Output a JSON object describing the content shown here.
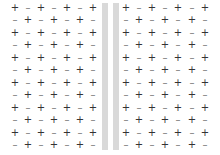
{
  "diagram": {
    "rows": 12,
    "cols_per_side": 7,
    "row_y": [
      8,
      20,
      33,
      45,
      58,
      70,
      83,
      95,
      108,
      120,
      133,
      145
    ],
    "left_col_x": [
      15,
      28,
      41,
      54,
      67,
      80,
      93
    ],
    "right_col_x": [
      126,
      139,
      152,
      165,
      178,
      192,
      205
    ],
    "plus_symbol": "+",
    "minus_symbol": "–",
    "odd_row_pattern": [
      "+",
      "–",
      "+",
      "–",
      "+",
      "–",
      "+"
    ],
    "even_row_pattern": [
      "–",
      "+",
      "–",
      "+",
      "–",
      "+",
      "–"
    ],
    "bars": [
      {
        "name": "left-barrier",
        "x": 102,
        "width": 6,
        "color": "#d9d9d9"
      },
      {
        "name": "right-barrier",
        "x": 113,
        "width": 6,
        "color": "#d9d9d9"
      }
    ],
    "colors": {
      "plus": "#333333",
      "minus": "#777777",
      "background": "#ffffff"
    }
  }
}
